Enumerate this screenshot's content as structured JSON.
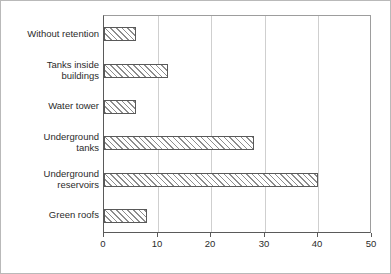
{
  "chart_data": {
    "type": "bar",
    "orientation": "horizontal",
    "title": "",
    "subtitle": "",
    "xlabel": "",
    "ylabel": "",
    "xlim": [
      0,
      50
    ],
    "xticks": [
      0,
      10,
      20,
      30,
      40,
      50
    ],
    "xtick_labels": [
      "0",
      "10",
      "20",
      "30",
      "40",
      "50"
    ],
    "grid": "vertical",
    "legend": "none",
    "categories": [
      "Without retention",
      "Tanks inside\nbuildings",
      "Water tower",
      "Underground\ntanks",
      "Underground\nreservoirs",
      "Green roofs"
    ],
    "values": [
      6,
      12,
      6,
      28,
      40,
      8
    ],
    "series": [
      {
        "name": "",
        "values": [
          6,
          12,
          6,
          28,
          40,
          8
        ]
      }
    ],
    "colors": {
      "bar_fill": "#ffffff",
      "bar_hatch": "#8d8d8d",
      "bar_border": "#595959",
      "gridline": "#cfcfcf",
      "axis": "#5a5a5a",
      "frame": "#9d9d9d",
      "text": "#2b2b2b",
      "page_border": "#b9b9b9",
      "background": "#ffffff"
    }
  }
}
